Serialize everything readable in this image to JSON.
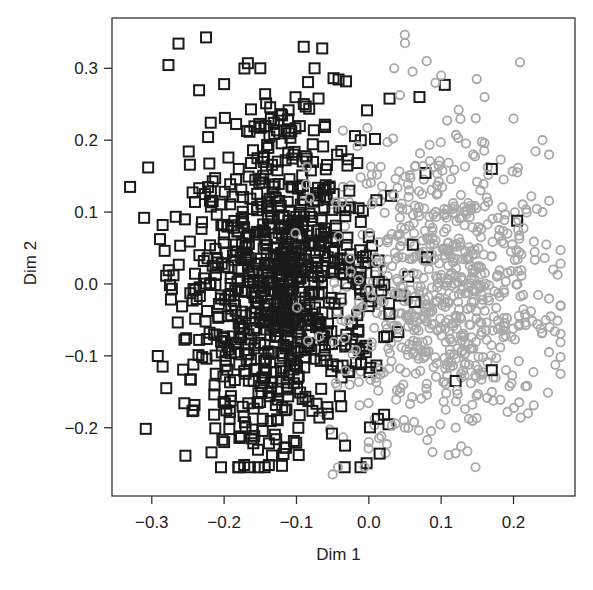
{
  "chart_data": {
    "type": "scatter",
    "title": "",
    "xlabel": "Dim 1",
    "ylabel": "Dim 2",
    "xlim": [
      -0.355,
      0.285
    ],
    "ylim": [
      -0.295,
      0.37
    ],
    "xticks": [
      -0.3,
      -0.2,
      -0.1,
      0.0,
      0.1,
      0.2
    ],
    "xtick_labels": [
      "−0.3",
      "−0.2",
      "−0.1",
      "0.0",
      "0.1",
      "0.2"
    ],
    "yticks": [
      -0.2,
      -0.1,
      0.0,
      0.1,
      0.2,
      0.3
    ],
    "ytick_labels": [
      "−0.2",
      "−0.1",
      "0.0",
      "0.1",
      "0.2",
      "0.3"
    ],
    "grid": false,
    "legend": null,
    "series": [
      {
        "name": "group-1",
        "marker": "square",
        "color": "#1a1a1a",
        "count": 900,
        "center": [
          -0.12,
          0.0
        ],
        "spread": [
          0.065,
          0.12
        ],
        "seed": 7,
        "notable_points": [
          [
            -0.33,
            0.135
          ],
          [
            -0.305,
            0.162
          ],
          [
            -0.285,
            0.082
          ],
          [
            -0.27,
            0.012
          ],
          [
            -0.225,
            0.343
          ],
          [
            -0.2,
            0.278
          ],
          [
            -0.28,
            -0.145
          ],
          [
            -0.285,
            -0.115
          ],
          [
            -0.255,
            -0.166
          ],
          [
            -0.2,
            -0.22
          ],
          [
            -0.12,
            -0.253
          ],
          [
            -0.075,
            0.3
          ],
          [
            0.07,
            0.26
          ],
          [
            0.105,
            0.277
          ],
          [
            0.17,
            0.16
          ],
          [
            0.205,
            0.088
          ],
          [
            0.17,
            -0.12
          ],
          [
            0.12,
            -0.135
          ],
          [
            -0.15,
            0.3
          ],
          [
            -0.09,
            0.33
          ]
        ]
      },
      {
        "name": "group-2",
        "marker": "circle",
        "color": "#a8a8a8",
        "count": 750,
        "center": [
          0.1,
          -0.005
        ],
        "spread": [
          0.075,
          0.11
        ],
        "seed": 19,
        "notable_points": [
          [
            0.05,
            0.335
          ],
          [
            0.035,
            0.3
          ],
          [
            0.1,
            0.29
          ],
          [
            0.16,
            0.26
          ],
          [
            0.24,
            0.2
          ],
          [
            0.24,
            0.1
          ],
          [
            0.25,
            -0.06
          ],
          [
            0.22,
            -0.18
          ],
          [
            0.0,
            -0.22
          ],
          [
            -0.05,
            -0.265
          ],
          [
            0.05,
            -0.2
          ],
          [
            0.12,
            -0.2
          ],
          [
            0.255,
            0.02
          ],
          [
            0.2,
            0.23
          ],
          [
            0.08,
            0.31
          ]
        ]
      }
    ]
  },
  "plot_area": {
    "left": 112,
    "top": 18,
    "right": 575,
    "bottom": 496
  }
}
